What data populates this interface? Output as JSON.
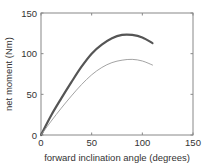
{
  "chart_data": {
    "type": "line",
    "title": "",
    "xlabel": "forward inclination angle (degrees)",
    "ylabel": "net moment (Nm)",
    "xlim": [
      0,
      150
    ],
    "ylim": [
      0,
      150
    ],
    "xticks": [
      0,
      50,
      100,
      150
    ],
    "yticks": [
      0,
      50,
      100,
      150
    ],
    "grid": false,
    "legend": null,
    "box": true,
    "series": [
      {
        "name": "thick curve",
        "style": "thick",
        "color": "#555555",
        "width": 2.2,
        "x": [
          0,
          10,
          20,
          30,
          40,
          50,
          60,
          70,
          80,
          90,
          100,
          110
        ],
        "y": [
          0,
          24,
          45,
          65,
          84,
          100,
          111,
          119,
          123,
          123,
          120,
          113
        ]
      },
      {
        "name": "thin curve",
        "style": "thin",
        "color": "#999999",
        "width": 0.9,
        "x": [
          0,
          10,
          20,
          30,
          40,
          50,
          60,
          70,
          80,
          90,
          100,
          110
        ],
        "y": [
          0,
          17,
          33,
          48,
          62,
          74,
          83,
          89,
          92,
          93,
          91,
          86
        ]
      }
    ]
  },
  "labels": {
    "x_axis": "forward inclination angle (degrees)",
    "y_axis": "net moment (Nm)"
  }
}
